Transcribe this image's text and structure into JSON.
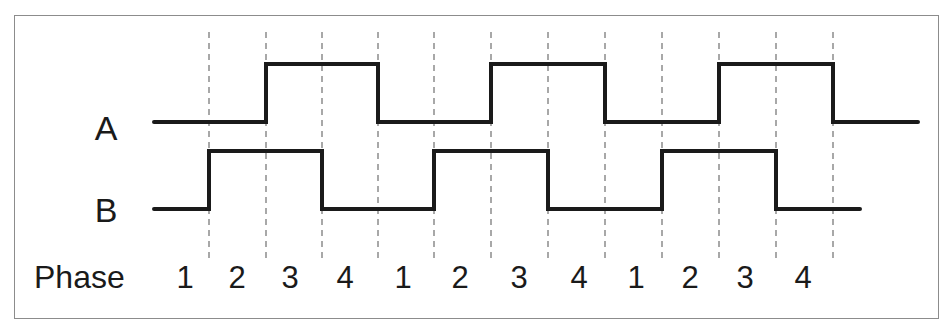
{
  "diagram": {
    "signals": [
      {
        "name": "A",
        "label": "A",
        "low_y": 122,
        "high_y": 64,
        "start_x": 154,
        "end_x": 918,
        "initial_level": "low",
        "transitions_at_boundary_index": [
          1,
          3,
          5,
          7,
          9,
          11
        ]
      },
      {
        "name": "B",
        "label": "B",
        "low_y": 209,
        "high_y": 151,
        "start_x": 154,
        "end_x": 860,
        "initial_level": "low",
        "transitions_at_boundary_index": [
          0,
          2,
          4,
          6,
          8,
          10
        ]
      }
    ],
    "boundaries_x": [
      209,
      266,
      322,
      378,
      434,
      491,
      548,
      605,
      662,
      719,
      776,
      833
    ],
    "phase_row": {
      "label": "Phase",
      "phases": [
        {
          "n": "1",
          "x": 185
        },
        {
          "n": "2",
          "x": 237
        },
        {
          "n": "3",
          "x": 290
        },
        {
          "n": "4",
          "x": 345
        },
        {
          "n": "1",
          "x": 403
        },
        {
          "n": "2",
          "x": 460
        },
        {
          "n": "3",
          "x": 519
        },
        {
          "n": "4",
          "x": 579
        },
        {
          "n": "1",
          "x": 636
        },
        {
          "n": "2",
          "x": 690
        },
        {
          "n": "3",
          "x": 745
        },
        {
          "n": "4",
          "x": 803
        }
      ]
    },
    "colors": {
      "signal": "#1a1a1a",
      "dash": "#7a7a7a",
      "border": "#8c8c8c",
      "text": "#1a1a1a"
    }
  }
}
